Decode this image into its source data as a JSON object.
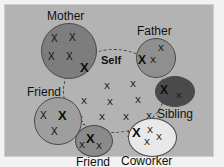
{
  "figure": {
    "kind": "social-network-ecomap-diagram",
    "background_color": "#f2f2f2",
    "panel_color": "#b3b3b3",
    "panel_border_color": "#cdcdcd",
    "mark_glyph": "X",
    "mark_color": "#0d0d0d"
  },
  "center": {
    "label": "Self",
    "fill": "#9a9a9a",
    "border_color": "#3d3d3d",
    "border_style": "dashed",
    "mark_count": 11,
    "marks": [
      {
        "x": 41,
        "y": 33,
        "size": 9,
        "bold": false
      },
      {
        "x": 67,
        "y": 31,
        "size": 9,
        "bold": false
      },
      {
        "x": 18,
        "y": 48,
        "size": 9,
        "bold": false
      },
      {
        "x": 44,
        "y": 49,
        "size": 9,
        "bold": false
      },
      {
        "x": 72,
        "y": 47,
        "size": 9,
        "bold": false
      },
      {
        "x": 36,
        "y": 64,
        "size": 9,
        "bold": false
      },
      {
        "x": 60,
        "y": 64,
        "size": 9,
        "bold": false
      },
      {
        "x": 14,
        "y": 66,
        "size": 9,
        "bold": false
      },
      {
        "x": 83,
        "y": 63,
        "size": 9,
        "bold": false
      },
      {
        "x": 27,
        "y": 80,
        "size": 9,
        "bold": false
      },
      {
        "x": 64,
        "y": 81,
        "size": 9,
        "bold": false
      }
    ]
  },
  "groups": [
    {
      "id": "mother",
      "label": "Mother",
      "label_position": "above",
      "fill": "#7d7d7d",
      "mark_count": 5,
      "marks": [
        {
          "x": 10,
          "y": 11,
          "size": 10,
          "bold": false
        },
        {
          "x": 28,
          "y": 10,
          "size": 10,
          "bold": false
        },
        {
          "x": 7,
          "y": 29,
          "size": 10,
          "bold": false
        },
        {
          "x": 25,
          "y": 29,
          "size": 10,
          "bold": false
        },
        {
          "x": 39,
          "y": 38,
          "size": 13,
          "bold": true
        }
      ]
    },
    {
      "id": "father",
      "label": "Father",
      "label_position": "above",
      "fill": "#8f8f8f",
      "mark_count": 3,
      "marks": [
        {
          "x": 2,
          "y": 16,
          "size": 12,
          "bold": true
        },
        {
          "x": 14,
          "y": 18,
          "size": 9,
          "bold": false
        },
        {
          "x": 22,
          "y": 6,
          "size": 9,
          "bold": false
        }
      ]
    },
    {
      "id": "sibling",
      "label": "Sibling",
      "label_position": "below",
      "fill": "#4a4a4a",
      "mark_count": 2,
      "marks": [
        {
          "x": 5,
          "y": 8,
          "size": 12,
          "bold": true
        },
        {
          "x": 21,
          "y": 16,
          "size": 8,
          "bold": false
        }
      ]
    },
    {
      "id": "friend-left",
      "label": "Friend",
      "label_position": "above",
      "fill": "#9e9e9e",
      "mark_count": 3,
      "marks": [
        {
          "x": 6,
          "y": 14,
          "size": 10,
          "bold": false
        },
        {
          "x": 24,
          "y": 12,
          "size": 13,
          "bold": true
        },
        {
          "x": 17,
          "y": 30,
          "size": 10,
          "bold": false
        }
      ]
    },
    {
      "id": "friend-bottom",
      "label": "Friend",
      "label_position": "below",
      "fill": "#8a8a8a",
      "mark_count": 3,
      "marks": [
        {
          "x": 11,
          "y": 7,
          "size": 13,
          "bold": true
        },
        {
          "x": 4,
          "y": 16,
          "size": 9,
          "bold": false
        },
        {
          "x": 21,
          "y": 17,
          "size": 9,
          "bold": false
        }
      ]
    },
    {
      "id": "coworker",
      "label": "Coworker",
      "label_position": "below",
      "fill": "#e8e8e8",
      "mark_count": 4,
      "marks": [
        {
          "x": 4,
          "y": 8,
          "size": 13,
          "bold": true
        },
        {
          "x": 19,
          "y": 8,
          "size": 9,
          "bold": false
        },
        {
          "x": 28,
          "y": 15,
          "size": 9,
          "bold": false
        },
        {
          "x": 16,
          "y": 20,
          "size": 9,
          "bold": false
        }
      ]
    }
  ]
}
